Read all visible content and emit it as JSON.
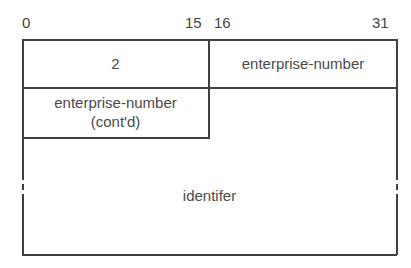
{
  "diagram": {
    "type": "packet-format",
    "bit_labels": {
      "start": "0",
      "mid_end": "15",
      "mid_start": "16",
      "end": "31"
    },
    "fields": [
      {
        "id": "type",
        "label": "2",
        "row": 1,
        "bits": "0-15"
      },
      {
        "id": "enterprise-number",
        "label": "enterprise-number",
        "row": 1,
        "bits": "16-31"
      },
      {
        "id": "enterprise-number-contd",
        "label_line1": "enterprise-number",
        "label_line2": "(cont'd)",
        "row": 2,
        "bits": "0-15"
      },
      {
        "id": "identifier",
        "label": "identifer",
        "row": 2,
        "bits": "16-31, variable length"
      }
    ],
    "colors": {
      "line": "#3f3f3f",
      "text": "#444444",
      "background": "#ffffff"
    }
  }
}
